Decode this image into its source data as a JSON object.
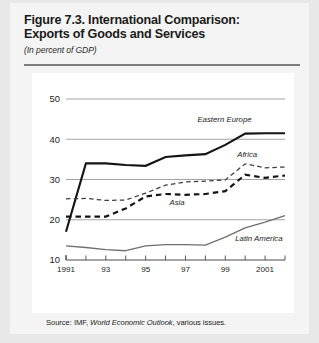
{
  "figure": {
    "title_line1": "Figure 7.3.  International Comparison:",
    "title_line2": "Exports of Goods and Services",
    "subtitle": "(In percent of GDP)",
    "source_prefix": "Source: IMF, ",
    "source_italic": "World Economic Outlook",
    "source_suffix": ", various issues."
  },
  "chart_data": {
    "type": "line",
    "title": "Figure 7.3.  International Comparison: Exports of Goods and Services",
    "subtitle": "(In percent of GDP)",
    "xlabel": "",
    "ylabel": "In percent of GDP",
    "xlim": [
      1991,
      2002
    ],
    "ylim": [
      10,
      50
    ],
    "yticks": [
      10,
      20,
      30,
      40,
      50
    ],
    "ytick_labels": [
      "10",
      "20",
      "30",
      "40",
      "50"
    ],
    "xticks": [
      1991,
      1992,
      1993,
      1994,
      1995,
      1996,
      1997,
      1998,
      1999,
      2000,
      2001,
      2002
    ],
    "xtick_labels": [
      "1991",
      "93",
      "95",
      "97",
      "99",
      "2001"
    ],
    "xtick_label_years": [
      1991,
      1993,
      1995,
      1997,
      1999,
      2001
    ],
    "grid": true,
    "grid_axis": "y",
    "legend_position": "inline-annotations",
    "x": [
      1991,
      1992,
      1993,
      1994,
      1995,
      1996,
      1997,
      1998,
      1999,
      2000,
      2001,
      2002
    ],
    "series": [
      {
        "name": "Eastern Europe",
        "style": "solid-thick",
        "color": "#141414",
        "label_x": 1997.6,
        "label_y": 44.2,
        "values": [
          17.0,
          34.0,
          34.0,
          33.6,
          33.4,
          35.6,
          36.0,
          36.3,
          38.6,
          41.4,
          41.5,
          41.5
        ]
      },
      {
        "name": "Africa",
        "style": "dashed-thin",
        "color": "#3d3d3d",
        "label_x": 1999.6,
        "label_y": 35.6,
        "values": [
          25.2,
          25.3,
          24.8,
          24.9,
          26.6,
          28.6,
          29.4,
          29.6,
          29.9,
          33.9,
          32.9,
          33.1
        ]
      },
      {
        "name": "Asia",
        "style": "dashed-thick",
        "color": "#141414",
        "label_x": 1996.2,
        "label_y": 23.6,
        "values": [
          20.8,
          20.8,
          20.8,
          22.8,
          25.8,
          26.4,
          26.2,
          26.4,
          27.1,
          31.2,
          30.4,
          31.0
        ]
      },
      {
        "name": "Latin America",
        "style": "solid-thin",
        "color": "#6f6f6f",
        "label_x": 1999.5,
        "label_y": 14.6,
        "values": [
          13.5,
          13.1,
          12.6,
          12.3,
          13.5,
          13.8,
          13.8,
          13.7,
          15.7,
          18.0,
          19.4,
          21.0
        ]
      }
    ]
  }
}
